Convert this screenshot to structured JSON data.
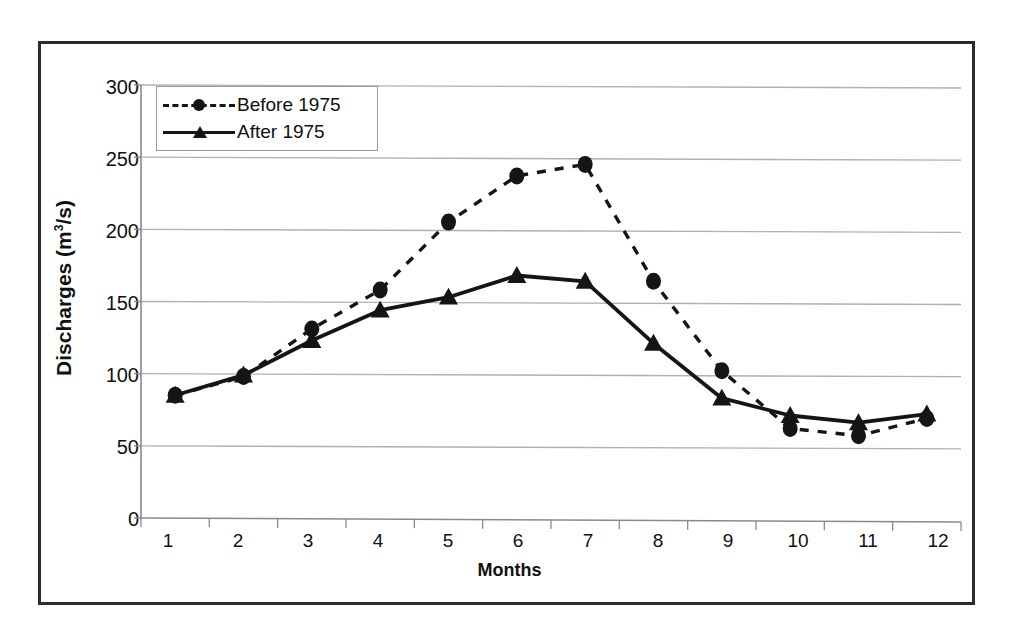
{
  "chart_data": {
    "type": "line",
    "title": "",
    "xlabel": "Months",
    "ylabel": "Discharges (m3/s)",
    "ylabel_base": "Discharges (m",
    "ylabel_sup": "3",
    "ylabel_tail": "/s)",
    "categories": [
      "1",
      "2",
      "3",
      "4",
      "5",
      "6",
      "7",
      "8",
      "9",
      "10",
      "11",
      "12"
    ],
    "x": [
      1,
      2,
      3,
      4,
      5,
      6,
      7,
      8,
      9,
      10,
      11,
      12
    ],
    "series": [
      {
        "name": "Before 1975",
        "values": [
          85,
          98,
          131,
          158,
          205,
          237,
          245,
          164,
          102,
          62,
          57,
          69
        ],
        "line_style": "dashed",
        "marker": "circle",
        "color": "#151515"
      },
      {
        "name": "After 1975",
        "values": [
          85,
          99,
          123,
          144,
          153,
          168,
          164,
          121,
          83,
          71,
          66,
          72
        ],
        "line_style": "solid",
        "marker": "triangle",
        "color": "#151515"
      }
    ],
    "ylim": [
      0,
      300
    ],
    "yticks": [
      0,
      50,
      100,
      150,
      200,
      250,
      300
    ],
    "ytick_labels": [
      "0",
      "50",
      "100",
      "150",
      "200",
      "250",
      "300"
    ],
    "xlim": [
      0.5,
      12.5
    ],
    "grid": "horizontal",
    "gridline_color": "#b0b0b0",
    "legend_position": "top-left",
    "axis_color": "#8a8a8a",
    "frame_color": "#2b2b2b",
    "background": "#ffffff"
  }
}
